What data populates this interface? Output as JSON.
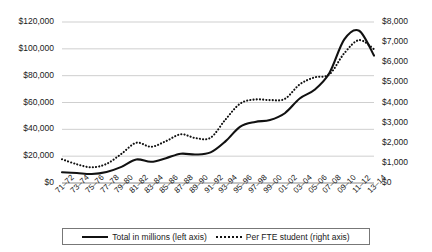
{
  "chart_data": {
    "type": "line",
    "title": "",
    "xlabel": "",
    "ylabel": "",
    "grid": true,
    "legend_position": "bottom",
    "categories": [
      "71–72",
      "73–74",
      "75–76",
      "77–78",
      "79–80",
      "81–82",
      "83–84",
      "85–86",
      "87–88",
      "89–90",
      "91–92",
      "93–94",
      "95–96",
      "97–98",
      "99–00",
      "01–02",
      "03–04",
      "05–06",
      "07–08",
      "09–10",
      "11–12",
      "13–14"
    ],
    "axes": {
      "left": {
        "label": "Total in millions",
        "ticks": [
          "$0",
          "$20,000",
          "$40,000",
          "$60,000",
          "$80,000",
          "$100,000",
          "$120,000"
        ],
        "min": 0,
        "max": 120000,
        "step": 20000
      },
      "right": {
        "label": "Per FTE student",
        "ticks": [
          "$0",
          "$1,000",
          "$2,000",
          "$3,000",
          "$4,000",
          "$5,000",
          "$6,000",
          "$7,000",
          "$8,000"
        ],
        "min": 0,
        "max": 8000,
        "step": 1000
      }
    },
    "series": [
      {
        "name": "Total in millions (left axis)",
        "axis": "left",
        "style": "solid",
        "color": "#111111",
        "values": [
          8000,
          7400,
          6700,
          8200,
          12000,
          17500,
          15800,
          18500,
          21800,
          21200,
          22800,
          31000,
          42000,
          45500,
          47000,
          52000,
          63000,
          69500,
          82000,
          107000,
          113500,
          95000
        ]
      },
      {
        "name": "Per FTE student (right axis)",
        "axis": "right",
        "style": "dotted",
        "color": "#111111",
        "values": [
          1180,
          930,
          780,
          950,
          1450,
          2000,
          1800,
          2080,
          2420,
          2230,
          2250,
          3150,
          3950,
          4150,
          4120,
          4180,
          4900,
          5250,
          5400,
          6450,
          7100,
          6650
        ]
      }
    ]
  },
  "legend": {
    "items": [
      {
        "label": "Total in millions (left axis)",
        "style": "solid"
      },
      {
        "label": "Per FTE student (right axis)",
        "style": "dotted"
      }
    ]
  }
}
